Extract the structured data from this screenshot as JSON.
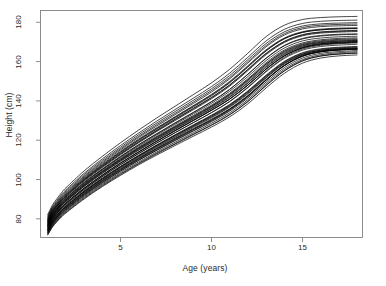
{
  "figure": {
    "background_color": "#ffffff",
    "line_color": "#000000",
    "axis_color": "#808080"
  },
  "axes": {
    "x_label": "Age (years)",
    "y_label": "Height (cm)",
    "x_ticks": [
      {
        "value": 5,
        "label": "5"
      },
      {
        "value": 10,
        "label": "10"
      },
      {
        "value": 15,
        "label": "15"
      }
    ],
    "y_ticks": [
      {
        "value": 80,
        "label": "80"
      },
      {
        "value": 100,
        "label": "100"
      },
      {
        "value": 120,
        "label": "120"
      },
      {
        "value": 140,
        "label": "140"
      },
      {
        "value": 160,
        "label": "160"
      },
      {
        "value": 180,
        "label": "180"
      }
    ]
  },
  "chart_data": {
    "type": "line",
    "title": "",
    "subtitle": "",
    "xlabel": "Age (years)",
    "ylabel": "Height (cm)",
    "xlim": [
      0.6,
      18.3
    ],
    "ylim": [
      70.5,
      186.0
    ],
    "grid": false,
    "legend": null,
    "legend_position": "none",
    "annotations": [],
    "x": [
      1,
      1.25,
      1.5,
      1.75,
      2,
      3,
      4,
      5,
      6,
      7,
      8,
      9,
      10,
      11,
      12,
      13,
      14,
      15,
      16,
      17,
      18
    ],
    "series": [
      {
        "name": "subject-01",
        "values": [
          76.2,
          80.4,
          83.2,
          85.8,
          88.0,
          95.6,
          102.2,
          108.4,
          114.1,
          119.6,
          125.0,
          130.2,
          135.4,
          141.0,
          148.1,
          156.2,
          163.0,
          167.1,
          169.0,
          169.8,
          170.2
        ]
      },
      {
        "name": "subject-02",
        "values": [
          74.5,
          78.6,
          81.5,
          84.0,
          86.2,
          93.8,
          100.3,
          106.4,
          112.0,
          117.3,
          122.4,
          127.3,
          132.2,
          137.6,
          144.5,
          152.4,
          159.4,
          163.8,
          165.8,
          166.6,
          167.0
        ]
      },
      {
        "name": "subject-03",
        "values": [
          78.0,
          82.3,
          85.3,
          88.0,
          90.4,
          98.4,
          105.2,
          111.6,
          117.6,
          123.2,
          128.6,
          134.0,
          139.5,
          145.8,
          153.6,
          161.8,
          168.2,
          171.8,
          173.3,
          173.9,
          174.1
        ]
      },
      {
        "name": "subject-04",
        "values": [
          73.0,
          77.0,
          79.9,
          82.4,
          84.6,
          92.0,
          98.4,
          104.3,
          109.8,
          115.0,
          120.0,
          124.9,
          129.8,
          135.2,
          142.1,
          150.5,
          158.0,
          162.9,
          165.2,
          166.1,
          166.5
        ]
      },
      {
        "name": "subject-05",
        "values": [
          77.1,
          81.4,
          84.4,
          87.1,
          89.4,
          97.2,
          103.9,
          110.1,
          115.9,
          121.4,
          126.7,
          131.9,
          137.2,
          143.2,
          150.6,
          158.6,
          165.0,
          168.6,
          170.2,
          170.9,
          171.2
        ]
      },
      {
        "name": "subject-06",
        "values": [
          75.4,
          79.6,
          82.5,
          85.1,
          87.3,
          94.9,
          101.5,
          107.6,
          113.3,
          118.7,
          123.9,
          129.0,
          134.1,
          139.8,
          147.0,
          155.2,
          162.1,
          166.4,
          168.3,
          169.1,
          169.5
        ]
      },
      {
        "name": "subject-07",
        "values": [
          79.2,
          83.6,
          86.7,
          89.5,
          91.9,
          100.1,
          107.1,
          113.7,
          119.9,
          125.7,
          131.3,
          136.9,
          142.6,
          149.2,
          157.2,
          165.4,
          171.6,
          174.9,
          176.2,
          176.7,
          176.9
        ]
      },
      {
        "name": "subject-08",
        "values": [
          72.1,
          76.0,
          78.8,
          81.2,
          83.3,
          90.5,
          96.8,
          102.6,
          108.0,
          113.1,
          118.0,
          122.8,
          127.6,
          132.9,
          139.6,
          147.8,
          155.2,
          160.3,
          162.8,
          163.8,
          164.3
        ]
      },
      {
        "name": "subject-09",
        "values": [
          76.8,
          81.1,
          84.1,
          86.8,
          89.1,
          96.9,
          103.6,
          109.8,
          115.6,
          121.0,
          126.3,
          131.5,
          136.8,
          142.7,
          150.0,
          158.0,
          164.5,
          168.2,
          169.8,
          170.5,
          170.8
        ]
      },
      {
        "name": "subject-10",
        "values": [
          74.0,
          78.1,
          80.9,
          83.4,
          85.6,
          93.0,
          99.4,
          105.3,
          110.8,
          116.0,
          121.0,
          125.9,
          130.7,
          136.0,
          142.8,
          150.9,
          158.1,
          162.8,
          165.0,
          165.9,
          166.3
        ]
      },
      {
        "name": "subject-11",
        "values": [
          80.1,
          84.6,
          87.7,
          90.6,
          93.0,
          101.3,
          108.4,
          115.1,
          121.4,
          127.3,
          133.0,
          138.7,
          144.5,
          151.2,
          159.3,
          167.5,
          173.5,
          176.6,
          177.8,
          178.2,
          178.4
        ]
      },
      {
        "name": "subject-12",
        "values": [
          75.9,
          80.1,
          83.0,
          85.6,
          87.9,
          95.5,
          102.1,
          108.3,
          114.0,
          119.5,
          124.8,
          130.0,
          135.2,
          140.9,
          148.0,
          156.1,
          162.8,
          166.9,
          168.7,
          169.4,
          169.8
        ]
      },
      {
        "name": "subject-13",
        "values": [
          73.6,
          77.6,
          80.5,
          82.9,
          85.1,
          92.5,
          98.9,
          104.8,
          110.3,
          115.5,
          120.5,
          125.4,
          130.2,
          135.6,
          142.4,
          150.6,
          157.9,
          162.7,
          165.0,
          165.9,
          166.3
        ]
      },
      {
        "name": "subject-14",
        "values": [
          78.5,
          82.9,
          85.9,
          88.7,
          91.1,
          99.2,
          106.1,
          112.6,
          118.7,
          124.5,
          130.0,
          135.5,
          141.1,
          147.5,
          155.4,
          163.5,
          169.7,
          173.1,
          174.5,
          175.0,
          175.3
        ]
      },
      {
        "name": "subject-15",
        "values": [
          77.5,
          81.8,
          84.8,
          87.5,
          89.8,
          97.7,
          104.4,
          110.7,
          116.5,
          122.0,
          127.3,
          132.6,
          137.9,
          143.9,
          151.3,
          159.4,
          165.9,
          169.5,
          171.1,
          171.8,
          172.1
        ]
      },
      {
        "name": "subject-16",
        "values": [
          72.8,
          76.8,
          79.6,
          82.0,
          84.2,
          91.5,
          97.8,
          103.6,
          109.0,
          114.1,
          119.0,
          123.8,
          128.6,
          133.9,
          140.6,
          148.7,
          156.0,
          161.0,
          163.5,
          164.5,
          165.0
        ]
      },
      {
        "name": "subject-17",
        "values": [
          76.5,
          80.8,
          83.7,
          86.4,
          88.7,
          96.4,
          103.0,
          109.2,
          114.9,
          120.3,
          125.6,
          130.8,
          136.0,
          141.8,
          149.0,
          157.0,
          163.6,
          167.5,
          169.2,
          169.9,
          170.3
        ]
      },
      {
        "name": "subject-18",
        "values": [
          79.8,
          84.2,
          87.3,
          90.2,
          92.6,
          100.8,
          107.8,
          114.4,
          120.6,
          126.4,
          132.0,
          137.6,
          143.3,
          149.9,
          157.9,
          166.0,
          172.0,
          175.2,
          176.5,
          177.0,
          177.2
        ]
      },
      {
        "name": "subject-19",
        "values": [
          74.8,
          78.9,
          81.8,
          84.3,
          86.5,
          94.0,
          100.5,
          106.5,
          112.1,
          117.4,
          122.5,
          127.5,
          132.5,
          137.9,
          144.8,
          152.8,
          159.8,
          164.2,
          166.2,
          167.0,
          167.4
        ]
      },
      {
        "name": "subject-20",
        "values": [
          81.0,
          85.5,
          88.7,
          91.6,
          94.1,
          102.5,
          109.7,
          116.4,
          122.8,
          128.8,
          134.6,
          140.3,
          146.2,
          152.9,
          161.0,
          169.2,
          175.1,
          178.1,
          179.2,
          179.6,
          179.8
        ]
      },
      {
        "name": "subject-21",
        "values": [
          75.1,
          79.2,
          82.1,
          84.6,
          86.8,
          94.3,
          100.8,
          106.8,
          112.4,
          117.7,
          122.8,
          127.8,
          132.8,
          138.2,
          145.1,
          153.1,
          160.1,
          164.5,
          166.5,
          167.3,
          167.7
        ]
      },
      {
        "name": "subject-22",
        "values": [
          78.8,
          83.2,
          86.2,
          89.0,
          91.4,
          99.6,
          106.5,
          113.0,
          119.1,
          124.9,
          130.5,
          136.0,
          141.6,
          148.0,
          155.9,
          164.0,
          170.1,
          173.5,
          174.9,
          175.4,
          175.7
        ]
      },
      {
        "name": "subject-23",
        "values": [
          73.3,
          77.3,
          80.2,
          82.6,
          84.8,
          92.1,
          98.4,
          104.3,
          109.8,
          114.9,
          119.8,
          124.6,
          129.4,
          134.8,
          141.5,
          149.6,
          156.9,
          161.8,
          164.2,
          165.1,
          165.6
        ]
      },
      {
        "name": "subject-24",
        "values": [
          77.8,
          82.1,
          85.1,
          87.9,
          90.2,
          98.1,
          104.9,
          111.2,
          117.1,
          122.7,
          128.1,
          133.4,
          138.8,
          144.9,
          152.4,
          160.5,
          166.9,
          170.5,
          172.0,
          172.6,
          172.9
        ]
      },
      {
        "name": "subject-25",
        "values": [
          76.0,
          80.2,
          83.1,
          85.7,
          88.0,
          95.6,
          102.2,
          108.4,
          114.1,
          119.5,
          124.8,
          130.0,
          135.2,
          140.9,
          148.1,
          156.2,
          162.9,
          167.0,
          168.8,
          169.5,
          169.9
        ]
      },
      {
        "name": "subject-26",
        "values": [
          71.8,
          75.7,
          78.5,
          80.9,
          83.0,
          90.1,
          96.4,
          102.1,
          107.5,
          112.5,
          117.3,
          122.0,
          126.7,
          131.9,
          138.5,
          146.6,
          154.0,
          159.2,
          161.8,
          162.9,
          163.4
        ]
      },
      {
        "name": "subject-27",
        "values": [
          79.5,
          83.9,
          87.0,
          89.8,
          92.2,
          100.4,
          107.4,
          114.0,
          120.2,
          126.0,
          131.7,
          137.3,
          143.0,
          149.5,
          157.5,
          165.6,
          171.6,
          174.8,
          176.1,
          176.6,
          176.8
        ]
      },
      {
        "name": "subject-28",
        "values": [
          74.3,
          78.4,
          81.2,
          83.7,
          85.9,
          93.3,
          99.7,
          105.7,
          111.2,
          116.5,
          121.5,
          126.5,
          131.4,
          136.8,
          143.6,
          151.7,
          158.8,
          163.3,
          165.4,
          166.2,
          166.6
        ]
      },
      {
        "name": "subject-29",
        "values": [
          77.3,
          81.6,
          84.6,
          87.3,
          89.6,
          97.4,
          104.1,
          110.3,
          116.1,
          121.6,
          126.9,
          132.1,
          137.4,
          143.4,
          150.8,
          158.8,
          165.3,
          169.0,
          170.6,
          171.3,
          171.6
        ]
      },
      {
        "name": "subject-30",
        "values": [
          72.5,
          76.4,
          79.2,
          81.6,
          83.8,
          91.0,
          97.3,
          103.0,
          108.4,
          113.5,
          118.3,
          123.1,
          127.8,
          133.1,
          139.8,
          147.9,
          155.3,
          160.4,
          162.9,
          163.9,
          164.4
        ]
      },
      {
        "name": "subject-31",
        "values": [
          80.5,
          85.0,
          88.1,
          91.0,
          93.5,
          101.8,
          109.0,
          115.7,
          122.0,
          128.0,
          133.7,
          139.4,
          145.3,
          151.9,
          160.0,
          168.2,
          174.2,
          177.3,
          178.5,
          178.9,
          179.1
        ]
      },
      {
        "name": "subject-32",
        "values": [
          75.6,
          79.8,
          82.7,
          85.2,
          87.5,
          95.0,
          101.5,
          107.6,
          113.2,
          118.6,
          123.8,
          128.9,
          134.0,
          139.6,
          146.7,
          154.8,
          161.6,
          165.8,
          167.7,
          168.4,
          168.8
        ]
      },
      {
        "name": "subject-33",
        "values": [
          78.2,
          82.5,
          85.5,
          88.3,
          90.6,
          98.6,
          105.4,
          111.8,
          117.8,
          123.4,
          128.9,
          134.2,
          139.7,
          145.9,
          153.5,
          161.6,
          168.0,
          171.5,
          173.0,
          173.6,
          173.9
        ]
      },
      {
        "name": "subject-34",
        "values": [
          73.9,
          78.0,
          80.8,
          83.3,
          85.5,
          92.8,
          99.2,
          105.1,
          110.6,
          115.8,
          120.7,
          125.6,
          130.4,
          135.8,
          142.5,
          150.6,
          157.9,
          162.7,
          165.0,
          165.9,
          166.4
        ]
      },
      {
        "name": "subject-35",
        "values": [
          76.7,
          81.0,
          83.9,
          86.6,
          88.9,
          96.6,
          103.3,
          109.5,
          115.2,
          120.6,
          125.9,
          131.1,
          136.3,
          142.1,
          149.3,
          157.4,
          164.0,
          167.9,
          169.6,
          170.3,
          170.7
        ]
      },
      {
        "name": "subject-36",
        "values": [
          79.0,
          83.4,
          86.4,
          89.2,
          91.6,
          99.8,
          106.7,
          113.2,
          119.3,
          125.1,
          130.7,
          136.2,
          141.8,
          148.2,
          156.1,
          164.2,
          170.3,
          173.7,
          175.1,
          175.6,
          175.9
        ]
      },
      {
        "name": "subject-37",
        "values": [
          74.7,
          78.8,
          81.6,
          84.1,
          86.3,
          93.7,
          100.1,
          106.1,
          111.6,
          116.9,
          121.9,
          126.9,
          131.8,
          137.2,
          144.0,
          152.0,
          159.1,
          163.6,
          165.7,
          166.5,
          166.9
        ]
      },
      {
        "name": "subject-38",
        "values": [
          81.5,
          86.1,
          89.3,
          92.3,
          94.8,
          103.2,
          110.5,
          117.3,
          123.7,
          129.8,
          135.6,
          141.4,
          147.3,
          154.1,
          162.2,
          170.5,
          176.4,
          179.4,
          180.5,
          180.9,
          181.1
        ]
      },
      {
        "name": "subject-39",
        "values": [
          82.2,
          86.9,
          90.2,
          93.2,
          95.8,
          104.4,
          111.8,
          118.7,
          125.2,
          131.4,
          137.3,
          143.2,
          149.2,
          156.1,
          164.3,
          172.7,
          178.5,
          181.4,
          182.4,
          182.8,
          183.0
        ]
      }
    ]
  }
}
